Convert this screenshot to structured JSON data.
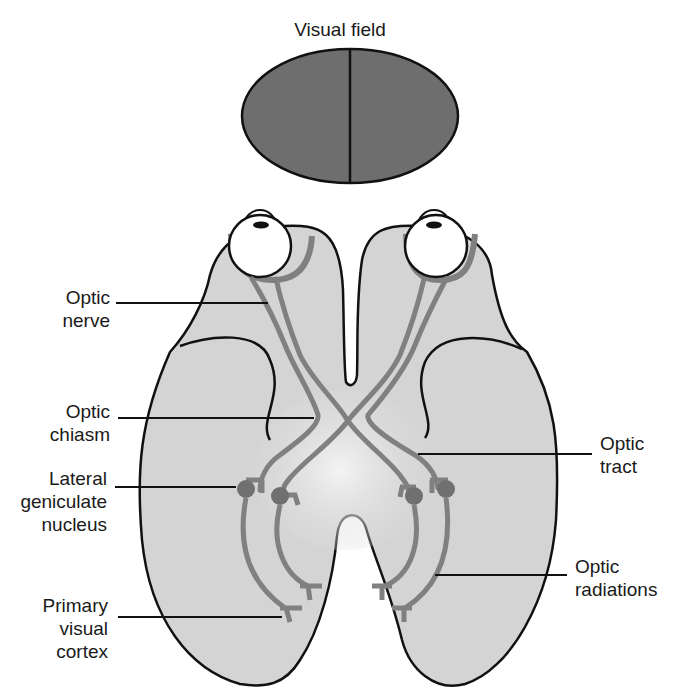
{
  "title": "Visual field",
  "colors": {
    "brain_fill": "#d4d4d4",
    "brain_center_highlight": "#f2f2f2",
    "pathway": "#808080",
    "visual_field_fill": "#6e6e6e",
    "outline": "#111111",
    "eye_fill": "#ffffff",
    "nucleus": "#707070"
  },
  "labels": {
    "optic_nerve": {
      "line1": "Optic",
      "line2": "nerve"
    },
    "optic_chiasm": {
      "line1": "Optic",
      "line2": "chiasm"
    },
    "lateral_geniculate_nucleus": {
      "line1": "Lateral",
      "line2": "geniculate",
      "line3": "nucleus"
    },
    "primary_visual_cortex": {
      "line1": "Primary",
      "line2": "visual",
      "line3": "cortex"
    },
    "optic_tract": {
      "line1": "Optic",
      "line2": "tract"
    },
    "optic_radiations": {
      "line1": "Optic",
      "line2": "radiations"
    }
  }
}
